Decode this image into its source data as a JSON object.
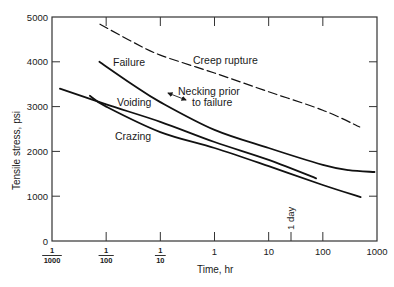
{
  "chart_data": {
    "type": "line",
    "title": "",
    "xlabel": "Time, hr",
    "ylabel": "Tensile stress, psi",
    "xscale": "log",
    "xlim": [
      0.001,
      1000
    ],
    "ylim": [
      0,
      5000
    ],
    "grid": false,
    "x_ticks": [
      {
        "value": 0.001,
        "num": "1",
        "den": "1000",
        "fraction": true
      },
      {
        "value": 0.01,
        "num": "1",
        "den": "100",
        "fraction": true
      },
      {
        "value": 0.1,
        "num": "1",
        "den": "10",
        "fraction": true
      },
      {
        "value": 1,
        "label": "1",
        "fraction": false
      },
      {
        "value": 10,
        "label": "10",
        "fraction": false
      },
      {
        "value": 100,
        "label": "100",
        "fraction": false
      },
      {
        "value": 1000,
        "label": "1000",
        "fraction": false
      }
    ],
    "y_ticks": [
      {
        "value": 0,
        "label": "0"
      },
      {
        "value": 1000,
        "label": "1000"
      },
      {
        "value": 2000,
        "label": "2000"
      },
      {
        "value": 3000,
        "label": "3000"
      },
      {
        "value": 4000,
        "label": "4000"
      },
      {
        "value": 5000,
        "label": "5000"
      }
    ],
    "series": [
      {
        "name": "Creep rupture",
        "style": "dashed",
        "points": [
          [
            0.0077,
            4840
          ],
          [
            0.03,
            4450
          ],
          [
            0.1,
            4150
          ],
          [
            1,
            3750
          ],
          [
            10,
            3330
          ],
          [
            100,
            2920
          ],
          [
            480,
            2545
          ]
        ]
      },
      {
        "name": "Failure",
        "style": "solid",
        "points": [
          [
            0.0075,
            4000
          ],
          [
            0.03,
            3500
          ],
          [
            0.1,
            3100
          ],
          [
            1,
            2480
          ],
          [
            10,
            2075
          ],
          [
            100,
            1700
          ],
          [
            300,
            1580
          ],
          [
            900,
            1540
          ]
        ]
      },
      {
        "name": "Voiding",
        "style": "solid",
        "points": [
          [
            0.0014,
            3400
          ],
          [
            0.01,
            3050
          ],
          [
            0.1,
            2660
          ],
          [
            1,
            2210
          ],
          [
            10,
            1810
          ],
          [
            75,
            1400
          ]
        ]
      },
      {
        "name": "Crazing",
        "style": "solid",
        "points": [
          [
            0.005,
            3240
          ],
          [
            0.01,
            3000
          ],
          [
            0.1,
            2430
          ],
          [
            1,
            2075
          ],
          [
            10,
            1670
          ],
          [
            100,
            1250
          ],
          [
            500,
            980
          ]
        ]
      }
    ],
    "annotations": [
      {
        "text": "Creep rupture",
        "series": "Creep rupture"
      },
      {
        "text": "Failure",
        "series": "Failure"
      },
      {
        "text": "Voiding",
        "series": "Voiding"
      },
      {
        "text": "Crazing",
        "series": "Crazing"
      },
      {
        "text_line1": "Necking prior",
        "text_line2": "to failure",
        "type": "double-arrow"
      },
      {
        "text": "1 day",
        "x": 24,
        "type": "vertical-marker"
      }
    ]
  }
}
